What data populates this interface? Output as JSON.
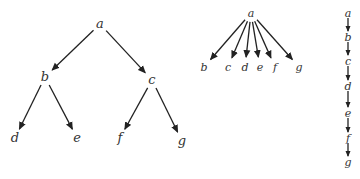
{
  "diagram": {
    "type": "trees",
    "colors": {
      "ink": "#222222",
      "background": "#ffffff"
    },
    "trees": [
      {
        "name": "binary-tree",
        "nodes": [
          {
            "id": "a",
            "label": "a",
            "x": 100,
            "y": 24
          },
          {
            "id": "b",
            "label": "b",
            "x": 45,
            "y": 77
          },
          {
            "id": "c",
            "label": "c",
            "x": 152,
            "y": 80
          },
          {
            "id": "d",
            "label": "d",
            "x": 15,
            "y": 138
          },
          {
            "id": "e",
            "label": "e",
            "x": 77,
            "y": 138
          },
          {
            "id": "f",
            "label": "f",
            "x": 120,
            "y": 138
          },
          {
            "id": "g",
            "label": "g",
            "x": 182,
            "y": 141
          }
        ],
        "edges": [
          [
            "a",
            "b"
          ],
          [
            "a",
            "c"
          ],
          [
            "b",
            "d"
          ],
          [
            "b",
            "e"
          ],
          [
            "c",
            "f"
          ],
          [
            "c",
            "g"
          ]
        ]
      },
      {
        "name": "star-tree",
        "nodes": [
          {
            "id": "a",
            "label": "a",
            "x": 251,
            "y": 13
          },
          {
            "id": "b",
            "label": "b",
            "x": 204,
            "y": 67
          },
          {
            "id": "c",
            "label": "c",
            "x": 228,
            "y": 67
          },
          {
            "id": "d",
            "label": "d",
            "x": 245,
            "y": 67
          },
          {
            "id": "e",
            "label": "e",
            "x": 260,
            "y": 67
          },
          {
            "id": "f",
            "label": "f",
            "x": 275,
            "y": 67
          },
          {
            "id": "g",
            "label": "g",
            "x": 299,
            "y": 67
          }
        ],
        "edges": [
          [
            "a",
            "b"
          ],
          [
            "a",
            "c"
          ],
          [
            "a",
            "d"
          ],
          [
            "a",
            "e"
          ],
          [
            "a",
            "f"
          ],
          [
            "a",
            "g"
          ]
        ]
      },
      {
        "name": "chain",
        "nodes": [
          {
            "id": "a",
            "label": "a",
            "x": 348,
            "y": 13
          },
          {
            "id": "b",
            "label": "b",
            "x": 348,
            "y": 37
          },
          {
            "id": "c",
            "label": "c",
            "x": 348,
            "y": 61
          },
          {
            "id": "d",
            "label": "d",
            "x": 348,
            "y": 86
          },
          {
            "id": "e",
            "label": "e",
            "x": 348,
            "y": 113
          },
          {
            "id": "f",
            "label": "f",
            "x": 348,
            "y": 138
          },
          {
            "id": "g",
            "label": "g",
            "x": 348,
            "y": 162
          }
        ],
        "edges": [
          [
            "a",
            "b"
          ],
          [
            "b",
            "c"
          ],
          [
            "c",
            "d"
          ],
          [
            "d",
            "e"
          ],
          [
            "e",
            "f"
          ],
          [
            "f",
            "g"
          ]
        ]
      }
    ]
  }
}
